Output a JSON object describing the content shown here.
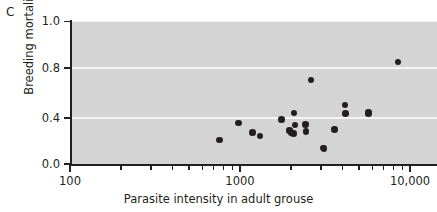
{
  "panel": {
    "letter": "C"
  },
  "chart_data": {
    "type": "scatter",
    "title": "",
    "panel_label": "C",
    "xlabel": "Parasite intensity in adult grouse",
    "ylabel": "Breeding mortality",
    "xscale": "log",
    "yscale": "linear",
    "xlim": [
      100,
      14000
    ],
    "ylim": [
      0.0,
      1.05
    ],
    "grid": true,
    "grid_orientation": "horizontal",
    "legend": null,
    "plot_background": "#d4d4d4",
    "gridline_color": "#f4f4f4",
    "marker_color": "#231f20",
    "xticks_major": [
      100,
      1000,
      10000
    ],
    "xtick_labels": [
      "100",
      "1000",
      "10,000"
    ],
    "xticks_minor": [
      200,
      300,
      400,
      500,
      600,
      700,
      800,
      900,
      2000,
      3000,
      4000,
      5000,
      6000,
      7000,
      8000,
      9000
    ],
    "yticks": [
      0.0,
      0.4,
      0.8,
      1.0
    ],
    "ytick_labels": [
      "0.0",
      "0.4",
      "0.8",
      "1.0"
    ],
    "points": [
      {
        "x": 760,
        "y": 0.21
      },
      {
        "x": 980,
        "y": 0.355
      },
      {
        "x": 1180,
        "y": 0.275
      },
      {
        "x": 1310,
        "y": 0.245
      },
      {
        "x": 1760,
        "y": 0.385
      },
      {
        "x": 1950,
        "y": 0.29
      },
      {
        "x": 2000,
        "y": 0.275
      },
      {
        "x": 2060,
        "y": 0.265
      },
      {
        "x": 2080,
        "y": 0.44
      },
      {
        "x": 2110,
        "y": 0.34
      },
      {
        "x": 2420,
        "y": 0.345
      },
      {
        "x": 2450,
        "y": 0.285
      },
      {
        "x": 2620,
        "y": 0.705
      },
      {
        "x": 3080,
        "y": 0.14
      },
      {
        "x": 3120,
        "y": 0.135
      },
      {
        "x": 3600,
        "y": 0.3
      },
      {
        "x": 4150,
        "y": 0.505
      },
      {
        "x": 4180,
        "y": 0.435
      },
      {
        "x": 5700,
        "y": 0.445
      },
      {
        "x": 5720,
        "y": 0.435
      },
      {
        "x": 8500,
        "y": 0.825
      }
    ]
  }
}
